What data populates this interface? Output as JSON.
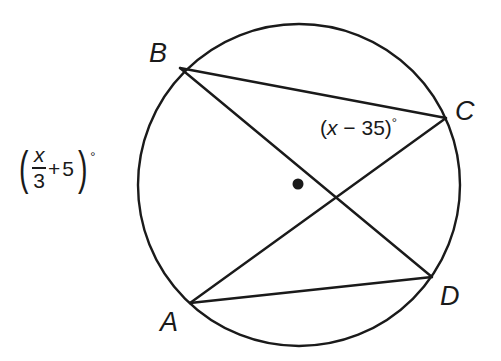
{
  "figure": {
    "type": "circle-geometry-diagram",
    "stroke_color": "#1a1a1a",
    "background_color": "#ffffff",
    "circle": {
      "center_x": 299,
      "center_y": 185,
      "radius": 161,
      "stroke_width": 2.4,
      "center_dot_radius": 5.5,
      "center_dot_label": "center-point"
    },
    "points": [
      {
        "id": "B",
        "label": "B",
        "x": 180,
        "y": 68,
        "label_x": 149,
        "label_y": 40
      },
      {
        "id": "C",
        "label": "C",
        "x": 446,
        "y": 118,
        "label_x": 455,
        "label_y": 98
      },
      {
        "id": "D",
        "label": "D",
        "x": 432,
        "y": 277,
        "label_x": 440,
        "label_y": 283
      },
      {
        "id": "A",
        "label": "A",
        "x": 190,
        "y": 303,
        "label_x": 160,
        "label_y": 309
      }
    ],
    "chords": [
      {
        "id": "BC",
        "from": "B",
        "to": "C",
        "x1": 180,
        "y1": 68,
        "x2": 446,
        "y2": 118
      },
      {
        "id": "BD",
        "from": "B",
        "to": "D",
        "x1": 180,
        "y1": 68,
        "x2": 432,
        "y2": 277
      },
      {
        "id": "AC",
        "from": "A",
        "to": "C",
        "x1": 190,
        "y1": 303,
        "x2": 446,
        "y2": 118
      },
      {
        "id": "AD",
        "from": "A",
        "to": "D",
        "x1": 190,
        "y1": 303,
        "x2": 432,
        "y2": 277
      }
    ],
    "chord_intersection": {
      "x": 340,
      "y": 198
    },
    "labels": {
      "angle_at_c": {
        "text": "(x − 35)°",
        "open_paren": "(",
        "variable": "x",
        "operator": "−",
        "number": "35",
        "close_paren": ")",
        "degree": "°",
        "x": 320,
        "y": 116,
        "describes": "inscribed angle BCA at vertex C"
      },
      "angle_left": {
        "text": "(x/3 + 5)°",
        "open_paren": "(",
        "numerator": "x",
        "denominator": "3",
        "operator": "+",
        "number": "5",
        "close_paren": ")",
        "degree": "°",
        "x": 16,
        "y": 145,
        "describes": "inscribed angle BDA measure expression"
      }
    }
  }
}
